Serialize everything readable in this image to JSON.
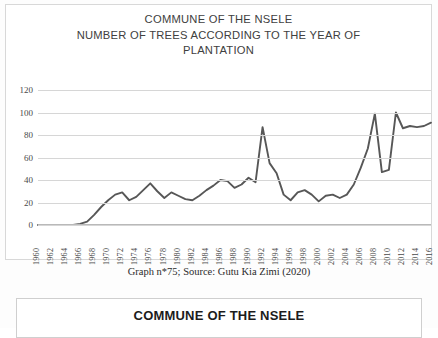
{
  "figure1": {
    "title_lines": [
      "COMMUNE OF THE NSELE",
      "NUMBER OF TREES ACCORDING TO THE YEAR OF",
      "PLANTATION"
    ],
    "caption": "Graph n*75; Source: Gutu Kia Zimi (2020)"
  },
  "figure2": {
    "title": "COMMUNE OF THE NSELE"
  },
  "colors": {
    "line": "#575757",
    "grid": "#d6d6d6",
    "text": "#404040",
    "border": "#d8d8d8"
  },
  "chart_data": {
    "type": "line",
    "title": "COMMUNE OF THE NSELE NUMBER OF TREES ACCORDING TO THE YEAR OF PLANTATION",
    "xlabel": "",
    "ylabel": "",
    "ylim": [
      0,
      120
    ],
    "ytick_step": 20,
    "yticks": [
      0,
      20,
      40,
      60,
      80,
      100,
      120
    ],
    "grid": true,
    "legend": "none",
    "xlabel_step": 2,
    "xtick_labels": [
      "1960",
      "1962",
      "1964",
      "1966",
      "1968",
      "1970",
      "1972",
      "1974",
      "1976",
      "1978",
      "1980",
      "1982",
      "1984",
      "1986",
      "1988",
      "1990",
      "1992",
      "1994",
      "1996",
      "1998",
      "2000",
      "2002",
      "2004",
      "2006",
      "2008",
      "2010",
      "2012",
      "2014",
      "2016"
    ],
    "x": [
      1960,
      1961,
      1962,
      1963,
      1964,
      1965,
      1966,
      1967,
      1968,
      1969,
      1970,
      1971,
      1972,
      1973,
      1974,
      1975,
      1976,
      1977,
      1978,
      1979,
      1980,
      1981,
      1982,
      1983,
      1984,
      1985,
      1986,
      1987,
      1988,
      1989,
      1990,
      1991,
      1992,
      1993,
      1994,
      1995,
      1996,
      1997,
      1998,
      1999,
      2000,
      2001,
      2002,
      2003,
      2004,
      2005,
      2006,
      2007,
      2008,
      2009,
      2010,
      2011,
      2012,
      2013,
      2014,
      2015,
      2016
    ],
    "values": [
      0,
      0,
      0,
      0,
      0,
      0,
      1,
      3,
      9,
      16,
      22,
      27,
      29,
      22,
      25,
      31,
      37,
      30,
      24,
      29,
      26,
      23,
      22,
      26,
      31,
      35,
      40,
      39,
      33,
      36,
      42,
      38,
      87,
      55,
      46,
      27,
      22,
      29,
      31,
      27,
      21,
      26,
      27,
      24,
      27,
      36,
      51,
      68,
      99,
      47,
      49,
      100,
      86,
      88,
      87,
      88,
      91
    ],
    "series": [
      {
        "name": "Number of trees",
        "values": [
          0,
          0,
          0,
          0,
          0,
          0,
          1,
          3,
          9,
          16,
          22,
          27,
          29,
          22,
          25,
          31,
          37,
          30,
          24,
          29,
          26,
          23,
          22,
          26,
          31,
          35,
          40,
          39,
          33,
          36,
          42,
          38,
          87,
          55,
          46,
          27,
          22,
          29,
          31,
          27,
          21,
          26,
          27,
          24,
          27,
          36,
          51,
          68,
          99,
          47,
          49,
          100,
          86,
          88,
          87,
          88,
          91
        ]
      }
    ]
  }
}
